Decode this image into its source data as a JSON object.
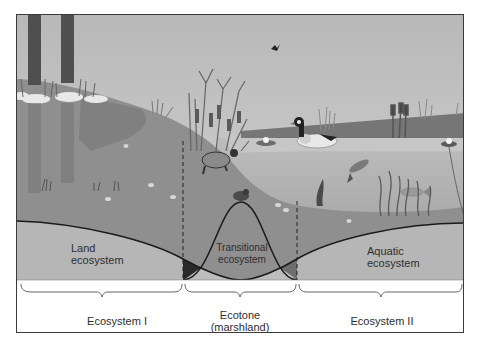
{
  "diagram": {
    "zones": {
      "land": {
        "line1": "Land",
        "line2": "ecosystem"
      },
      "transitional": {
        "line1": "Transitional",
        "line2": "ecosystem"
      },
      "aquatic": {
        "line1": "Aquatic",
        "line2": "ecosystem"
      }
    },
    "bottom_labels": {
      "ecosystem_1": "Ecosystem I",
      "ecotone_line1": "Ecotone",
      "ecotone_line2": "(marshland)",
      "ecosystem_2": "Ecosystem II"
    },
    "scene_elements": [
      "trees",
      "reeds",
      "cattails",
      "turtle",
      "frog",
      "duck",
      "water-lilies",
      "fish",
      "bird",
      "seaweed"
    ],
    "colors": {
      "sky": "#c9c9c9",
      "land": "#8e8e8e",
      "water_surface": "#b9b9b9",
      "water_deep": "#a6a6a6",
      "curve_band": "#b3b3b3",
      "overlap_land": "#2a2a2a",
      "overlap_aquatic": "#6e6e6e",
      "line": "#1a1a1a"
    }
  }
}
